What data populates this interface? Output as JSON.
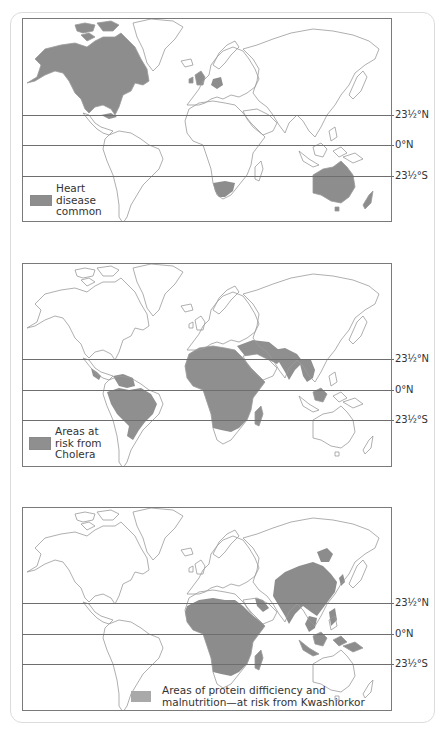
{
  "colors": {
    "heart_fill": "#8d8d8d",
    "cholera_fill": "#8f8f8f",
    "kwash_fill": "#8c8c8c",
    "kwash_swatch": "#a9a9a9",
    "outline": "#9a9a9a",
    "frame": "#7a7a7a",
    "card_border": "#dcdcdc"
  },
  "maps": [
    {
      "id": "heart-disease",
      "legend_lines": [
        "Heart",
        "disease",
        "common"
      ],
      "latitudes": [
        {
          "label": "23½°N",
          "label_parts": [
            "23",
            "½",
            "°N"
          ]
        },
        {
          "label": "0°N"
        },
        {
          "label": "23½°S",
          "label_parts": [
            "23",
            "½",
            "°S"
          ]
        }
      ],
      "highlighted_regions": [
        "North America (Canada, USA)",
        "Cuba",
        "Great Britain & Ireland",
        "Germany / Central Europe",
        "South Africa",
        "Australia",
        "New Zealand"
      ]
    },
    {
      "id": "cholera",
      "legend_lines": [
        "Areas at",
        "risk from",
        "Cholera"
      ],
      "latitudes": [
        {
          "label": "23½°N",
          "label_parts": [
            "23",
            "½",
            "°N"
          ]
        },
        {
          "label": "0°N"
        },
        {
          "label": "23½°S",
          "label_parts": [
            "23",
            "½",
            "°S"
          ]
        }
      ],
      "highlighted_regions": [
        "Central America",
        "Northern South America",
        "Brazil",
        "Africa (except South Africa)",
        "Madagascar",
        "Middle East",
        "India",
        "Southeast Asia",
        "Borneo"
      ]
    },
    {
      "id": "kwashiorkor",
      "legend_lines": [
        "Areas of protein difficiency and",
        "malnutrition—at risk from Kwashiorkor"
      ],
      "latitudes": [
        {
          "label": "23½°N",
          "label_parts": [
            "23",
            "½",
            "°N"
          ]
        },
        {
          "label": "0°N"
        },
        {
          "label": "23½°S",
          "label_parts": [
            "23",
            "½",
            "°S"
          ]
        }
      ],
      "highlighted_regions": [
        "Africa (except South Africa)",
        "Madagascar",
        "Yemen / Arabia south",
        "India",
        "China",
        "Korea",
        "Southeast Asia",
        "Indonesia",
        "Philippines",
        "New Guinea"
      ]
    }
  ]
}
